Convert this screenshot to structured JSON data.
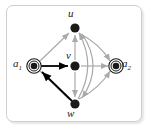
{
  "figure": {
    "kind": "directed-graph-diagram",
    "frame": {
      "border_color": "#cfcfcf",
      "background": "#ffffff",
      "radius_px": 7
    }
  },
  "palette": {
    "node_fill": "#1a1a1a",
    "node_stroke": "#1a1a1a",
    "accept_ring": "#1a1a1a",
    "bold_edge": "#000000",
    "light_edge": "#a9a9a9",
    "label_color": "#1a1a1a"
  },
  "graph": {
    "nodes": [
      {
        "id": "a1",
        "label": "a",
        "sub": "1",
        "x": 34,
        "y": 66,
        "style": "double-ring",
        "label_pos": "left"
      },
      {
        "id": "u",
        "label": "u",
        "sub": "",
        "x": 75,
        "y": 28,
        "style": "filled",
        "label_pos": "above"
      },
      {
        "id": "v",
        "label": "v",
        "sub": "",
        "x": 75,
        "y": 66,
        "style": "filled",
        "label_pos": "above"
      },
      {
        "id": "w",
        "label": "w",
        "sub": "",
        "x": 75,
        "y": 104,
        "style": "filled",
        "label_pos": "below"
      },
      {
        "id": "a2",
        "label": "a",
        "sub": "2",
        "x": 116,
        "y": 66,
        "style": "double-ring",
        "label_pos": "right"
      }
    ],
    "edges": [
      {
        "from": "a1",
        "to": "v",
        "weight": "bold",
        "shape": "straight"
      },
      {
        "from": "w",
        "to": "a1",
        "weight": "bold",
        "shape": "straight"
      },
      {
        "from": "a1",
        "to": "u",
        "weight": "light",
        "shape": "straight"
      },
      {
        "from": "a1",
        "to": "w",
        "weight": "light",
        "shape": "straight"
      },
      {
        "from": "u",
        "to": "v",
        "weight": "light",
        "shape": "straight"
      },
      {
        "from": "v",
        "to": "u",
        "weight": "light",
        "shape": "straight"
      },
      {
        "from": "v",
        "to": "w",
        "weight": "light",
        "shape": "straight"
      },
      {
        "from": "v",
        "to": "a2",
        "weight": "light",
        "shape": "straight"
      },
      {
        "from": "u",
        "to": "a2",
        "weight": "light",
        "shape": "curved"
      },
      {
        "from": "w",
        "to": "a2",
        "weight": "light",
        "shape": "curved"
      },
      {
        "from": "w",
        "to": "u",
        "weight": "light",
        "shape": "curved"
      },
      {
        "from": "u",
        "to": "w",
        "weight": "light",
        "shape": "curved"
      }
    ]
  },
  "labels": {
    "u": "u",
    "v": "v",
    "w": "w",
    "a1_base": "a",
    "a1_sub": "1",
    "a2_base": "a",
    "a2_sub": "2"
  }
}
